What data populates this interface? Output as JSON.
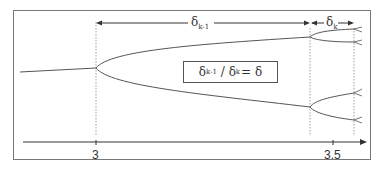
{
  "figure": {
    "annotations": {
      "delta_symbol": "δ",
      "interval_1": {
        "symbol": "δ",
        "subscript": "k-1"
      },
      "interval_2": {
        "symbol": "δ",
        "subscript": "k"
      },
      "ratio_box": {
        "numerator_symbol": "δ",
        "numerator_sub": "k-1",
        "slash": " / ",
        "denominator_symbol": "δ",
        "denominator_sub": "k",
        "equals": "= δ"
      }
    },
    "axis": {
      "ticks": [
        {
          "label": "3",
          "x": 96
        },
        {
          "label": "3.5",
          "x": 333
        }
      ]
    },
    "colors": {
      "line": "#555555",
      "frame": "#777777",
      "text": "#333333"
    }
  }
}
